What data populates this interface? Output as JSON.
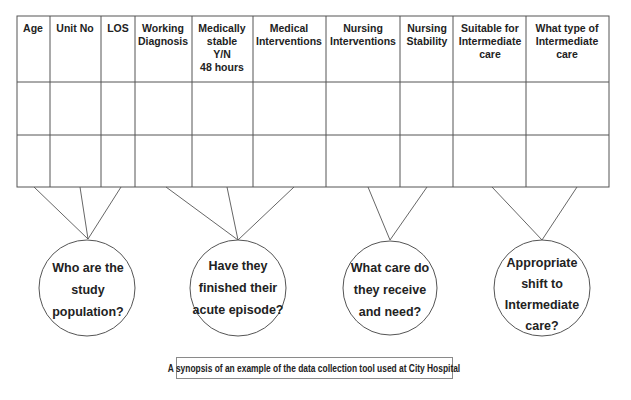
{
  "title_fragment": "",
  "table": {
    "columns": [
      {
        "label": "Age",
        "lines": [
          "Age"
        ]
      },
      {
        "label": "Unit No",
        "lines": [
          "Unit No"
        ]
      },
      {
        "label": "LOS",
        "lines": [
          "LOS"
        ]
      },
      {
        "label": "Working Diagnosis",
        "lines": [
          "Working",
          "Diagnosis"
        ]
      },
      {
        "label": "Medically stable Y/N 48 hours",
        "lines": [
          "Medically",
          "stable",
          "Y/N",
          "48 hours"
        ]
      },
      {
        "label": "Medical Interventions",
        "lines": [
          "Medical",
          "Interventions"
        ]
      },
      {
        "label": "Nursing Interventions",
        "lines": [
          "Nursing",
          "Interventions"
        ]
      },
      {
        "label": "Nursing Stability",
        "lines": [
          "Nursing",
          "Stability"
        ]
      },
      {
        "label": "Suitable for Intermediate care",
        "lines": [
          "Suitable for",
          "Intermediate",
          "care"
        ]
      },
      {
        "label": "What type of Intermediate care",
        "lines": [
          "What type of",
          "Intermediate",
          "care"
        ]
      }
    ],
    "rows": [
      [
        "",
        "",
        "",
        "",
        "",
        "",
        "",
        "",
        "",
        ""
      ],
      [
        "",
        "",
        "",
        "",
        "",
        "",
        "",
        "",
        "",
        ""
      ]
    ]
  },
  "questions": [
    {
      "id": "study-population",
      "lines": [
        "Who are the",
        "study",
        "population?"
      ],
      "linked_columns": [
        "Age",
        "Unit No",
        "LOS"
      ]
    },
    {
      "id": "acute-episode",
      "lines": [
        "Have they",
        "finished their",
        "acute episode?"
      ],
      "linked_columns": [
        "Working Diagnosis",
        "Medically stable Y/N 48 hours",
        "Medical Interventions"
      ]
    },
    {
      "id": "care-received",
      "lines": [
        "What care do",
        "they receive",
        "and need?"
      ],
      "linked_columns": [
        "Nursing Interventions",
        "Nursing Stability"
      ]
    },
    {
      "id": "intermediate-shift",
      "lines": [
        "Appropriate",
        "shift to",
        "Intermediate",
        "care?"
      ],
      "linked_columns": [
        "Suitable for Intermediate care",
        "What type of Intermediate care"
      ]
    }
  ],
  "caption": "A synopsis of an example of the data collection tool used at City Hospital",
  "colors": {
    "line": "#555555",
    "text": "#222222",
    "background": "#ffffff"
  }
}
